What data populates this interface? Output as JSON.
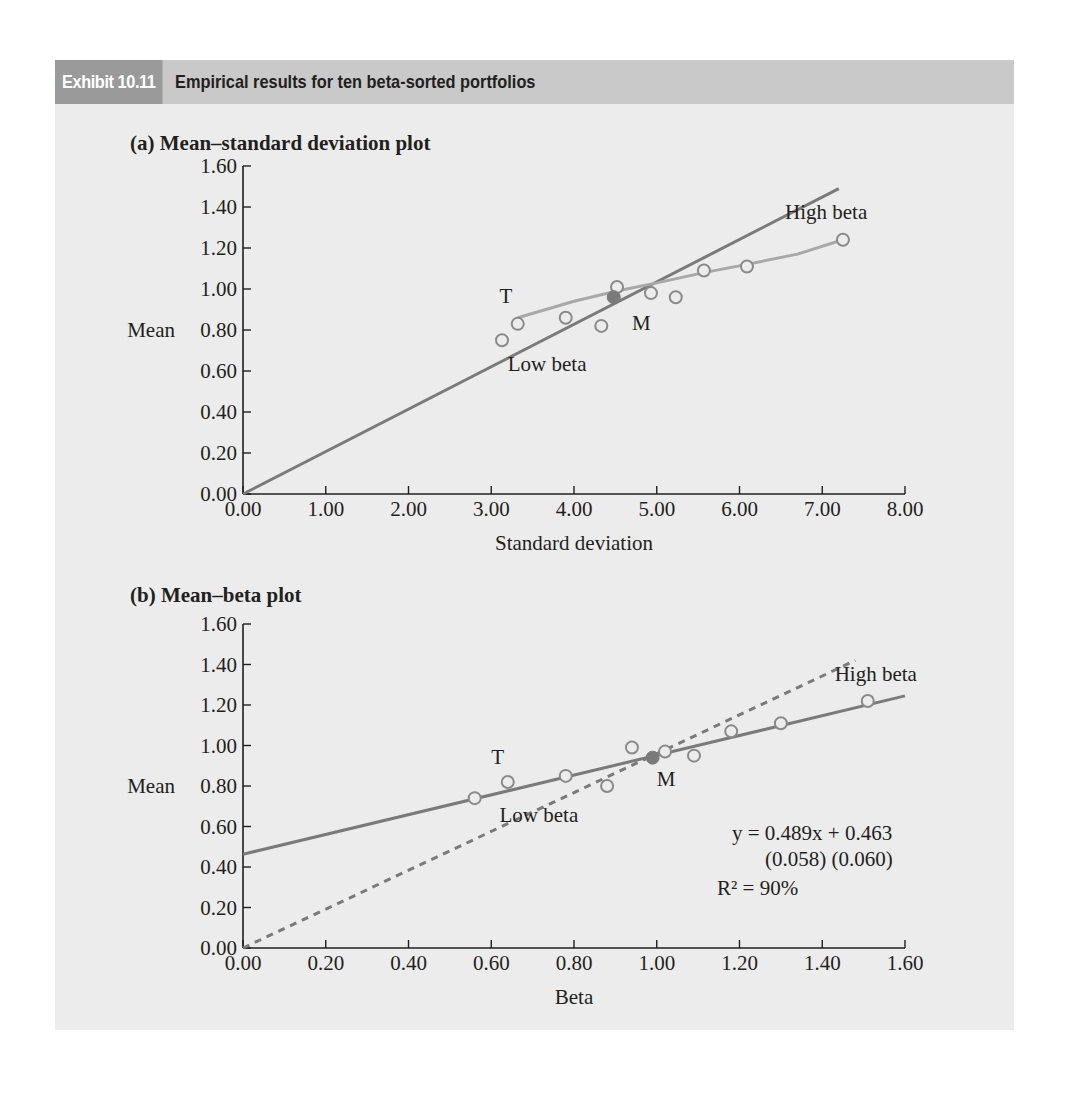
{
  "header": {
    "exhibit_tag": "Exhibit 10.11",
    "title": "Empirical results for ten beta-sorted portfolios"
  },
  "colors": {
    "panel_bg": "#ececec",
    "header_bar": "#c9c9c9",
    "header_tag": "#9a9a9a",
    "line_dark": "#7a7a7a",
    "line_light": "#a8a8a8",
    "marker": "#8a8a8a",
    "market_marker": "#7a7a7a"
  },
  "chart_data": [
    {
      "type": "scatter",
      "panel": "(a)",
      "title": "Mean–standard deviation plot",
      "xlabel": "Standard deviation",
      "ylabel": "Mean",
      "xlim": [
        0,
        8
      ],
      "ylim": [
        0,
        1.6
      ],
      "x_ticks": [
        "0.00",
        "1.00",
        "2.00",
        "3.00",
        "4.00",
        "5.00",
        "6.00",
        "7.00",
        "8.00"
      ],
      "y_ticks": [
        "0.00",
        "0.20",
        "0.40",
        "0.60",
        "0.80",
        "1.00",
        "1.20",
        "1.40",
        "1.60"
      ],
      "grid": false,
      "series": [
        {
          "name": "Portfolios",
          "marker": "open-circle",
          "x": [
            3.13,
            3.32,
            3.9,
            4.33,
            4.52,
            4.93,
            5.23,
            5.57,
            6.09,
            7.25
          ],
          "y": [
            0.75,
            0.83,
            0.86,
            0.82,
            1.01,
            0.98,
            0.96,
            1.09,
            1.11,
            1.24
          ]
        },
        {
          "name": "Market (M)",
          "marker": "filled-circle",
          "x": [
            4.48
          ],
          "y": [
            0.96
          ]
        },
        {
          "name": "Tangency line",
          "style": "solid-dark",
          "x": [
            0,
            7.2
          ],
          "y": [
            0,
            1.49
          ]
        },
        {
          "name": "Efficient frontier",
          "style": "solid-light",
          "x": [
            3.32,
            4.0,
            4.52,
            5.0,
            5.57,
            6.09,
            6.7,
            7.25
          ],
          "y": [
            0.86,
            0.94,
            0.99,
            1.03,
            1.08,
            1.12,
            1.17,
            1.24
          ]
        }
      ],
      "annotations": [
        {
          "text": "T",
          "x": 3.1,
          "y": 0.93
        },
        {
          "text": "M",
          "x": 4.7,
          "y": 0.8
        },
        {
          "text": "Low beta",
          "x": 3.2,
          "y": 0.6
        },
        {
          "text": "High beta",
          "x": 6.55,
          "y": 1.34
        }
      ]
    },
    {
      "type": "scatter",
      "panel": "(b)",
      "title": "Mean–beta plot",
      "xlabel": "Beta",
      "ylabel": "Mean",
      "xlim": [
        0,
        1.6
      ],
      "ylim": [
        0,
        1.6
      ],
      "x_ticks": [
        "0.00",
        "0.20",
        "0.40",
        "0.60",
        "0.80",
        "1.00",
        "1.20",
        "1.40",
        "1.60"
      ],
      "y_ticks": [
        "0.00",
        "0.20",
        "0.40",
        "0.60",
        "0.80",
        "1.00",
        "1.20",
        "1.40",
        "1.60"
      ],
      "grid": false,
      "series": [
        {
          "name": "Portfolios",
          "marker": "open-circle",
          "x": [
            0.56,
            0.64,
            0.78,
            0.88,
            0.94,
            1.02,
            1.09,
            1.18,
            1.3,
            1.51
          ],
          "y": [
            0.74,
            0.82,
            0.85,
            0.8,
            0.99,
            0.97,
            0.95,
            1.07,
            1.11,
            1.22
          ]
        },
        {
          "name": "Market (M)",
          "marker": "filled-circle",
          "x": [
            0.99
          ],
          "y": [
            0.94
          ]
        },
        {
          "name": "Fitted line",
          "style": "solid",
          "x": [
            0,
            1.6
          ],
          "y": [
            0.463,
            1.245
          ]
        },
        {
          "name": "Theoretical SML",
          "style": "dashed",
          "x": [
            0,
            1.48
          ],
          "y": [
            0,
            1.42
          ]
        }
      ],
      "regression": {
        "equation": "y = 0.489x + 0.463",
        "std_errors": "(0.058) (0.060)",
        "r_squared": "R² = 90%",
        "slope": 0.489,
        "intercept": 0.463,
        "r2_pct": 90
      },
      "annotations": [
        {
          "text": "T",
          "x": 0.6,
          "y": 0.91
        },
        {
          "text": "M",
          "x": 1.0,
          "y": 0.8
        },
        {
          "text": "Low beta",
          "x": 0.62,
          "y": 0.62
        },
        {
          "text": "High beta",
          "x": 1.43,
          "y": 1.32
        }
      ]
    }
  ],
  "labels": {
    "panel_a_title": "(a)  Mean–standard deviation plot",
    "panel_b_title": "(b)  Mean–beta plot",
    "mean": "Mean",
    "std_dev": "Standard deviation",
    "beta": "Beta",
    "T": "T",
    "M": "M",
    "low_beta": "Low beta",
    "high_beta": "High beta",
    "eq_line1": "y = 0.489x + 0.463",
    "eq_line2": "(0.058) (0.060)",
    "eq_line3": "R² = 90%"
  }
}
